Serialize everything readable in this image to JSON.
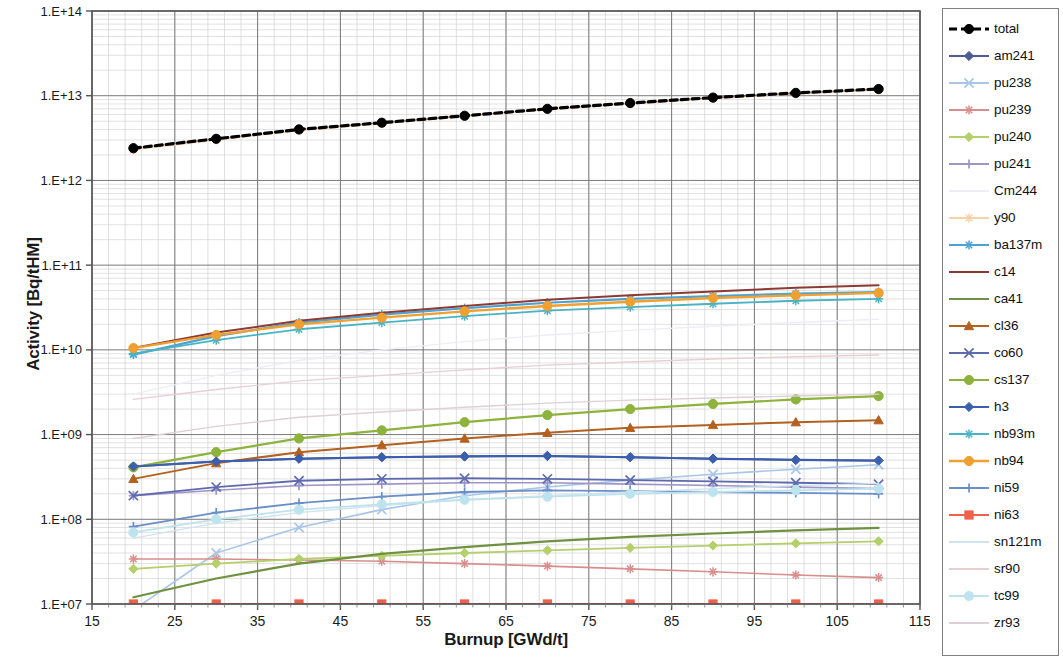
{
  "chart_data": {
    "type": "line",
    "title": "",
    "xlabel": "Burnup [GWd/t]",
    "ylabel": "Activity [Bq/tHM]",
    "yscale": "log",
    "xlim": [
      15,
      115
    ],
    "ylim": [
      10000000.0,
      100000000000000.0
    ],
    "xticks": [
      15,
      25,
      35,
      45,
      55,
      65,
      75,
      85,
      95,
      105,
      115
    ],
    "xtick_labels": [
      "15",
      "25",
      "35",
      "45",
      "55",
      "65",
      "75",
      "85",
      "95",
      "105",
      "115"
    ],
    "yticks": [
      10000000.0,
      100000000.0,
      1000000000.0,
      10000000000.0,
      100000000000.0,
      1000000000000.0,
      10000000000000.0,
      100000000000000.0
    ],
    "ytick_labels": [
      "1.E+07",
      "1.E+08",
      "1.E+09",
      "1.E+10",
      "1.E+11",
      "1.E+12",
      "1.E+13",
      "1.E+14"
    ],
    "grid": true,
    "minor_grid": true,
    "legend_position": "right",
    "x": [
      20,
      30,
      40,
      50,
      60,
      70,
      80,
      90,
      100,
      110
    ],
    "series": [
      {
        "name": "total",
        "color": "#000000",
        "marker": "circle",
        "marker_color": "#000000",
        "width": 3.2,
        "dash": "7,4",
        "values": [
          2400000000000.0,
          3100000000000.0,
          4000000000000.0,
          4800000000000.0,
          5800000000000.0,
          7000000000000.0,
          8200000000000.0,
          9500000000000.0,
          10800000000000.0,
          12000000000000.0
        ]
      },
      {
        "name": "am241",
        "color": "#4a5d96",
        "marker": "diamond",
        "width": 2.0,
        "values": [
          420000000.0,
          480000000.0,
          520000000.0,
          540000000.0,
          550000000.0,
          560000000.0,
          540000000.0,
          520000000.0,
          500000000.0,
          490000000.0
        ]
      },
      {
        "name": "pu238",
        "color": "#a8c6e8",
        "marker": "x",
        "width": 1.6,
        "values": [
          8500000.0,
          40000000.0,
          80000000.0,
          130000000.0,
          190000000.0,
          240000000.0,
          290000000.0,
          340000000.0,
          390000000.0,
          440000000.0
        ]
      },
      {
        "name": "pu239",
        "color": "#d98d8d",
        "marker": "star",
        "width": 1.6,
        "values": [
          34000000.0,
          34000000.0,
          33000000.0,
          32000000.0,
          30000000.0,
          28000000.0,
          26000000.0,
          24000000.0,
          22000000.0,
          20500000.0
        ]
      },
      {
        "name": "pu240",
        "color": "#b5cf6b",
        "marker": "diamond",
        "width": 1.8,
        "values": [
          26000000.0,
          30000000.0,
          34000000.0,
          37000000.0,
          40000000.0,
          43000000.0,
          46000000.0,
          49000000.0,
          52000000.0,
          55000000.0
        ]
      },
      {
        "name": "pu241",
        "color": "#9d96c6",
        "marker": "plus",
        "width": 1.6,
        "values": [
          190000000.0,
          220000000.0,
          250000000.0,
          260000000.0,
          270000000.0,
          270000000.0,
          260000000.0,
          250000000.0,
          240000000.0,
          230000000.0
        ]
      },
      {
        "name": "Cm244",
        "color": "#f0ecf5",
        "marker": "none",
        "width": 1.4,
        "values": [
          3000000000.0,
          5000000000.0,
          7500000000.0,
          10000000000.0,
          12500000000.0,
          15000000000.0,
          17000000000.0,
          19000000000.0,
          21000000000.0,
          23000000000.0
        ]
      },
      {
        "name": "y90",
        "color": "#f9d0a8",
        "marker": "star",
        "width": 1.6,
        "values": [
          2300000000000.0,
          3000000000000.0,
          3900000000000.0,
          4700000000000.0,
          5700000000000.0,
          6900000000000.0,
          8000000000000.0,
          9300000000000.0,
          10500000000000.0,
          11700000000000.0
        ]
      },
      {
        "name": "ba137m",
        "color": "#4ba3d3",
        "marker": "star",
        "width": 2.2,
        "values": [
          8800000000.0,
          14500000000.0,
          21000000000.0,
          26000000000.0,
          31000000000.0,
          36000000000.0,
          40000000000.0,
          43000000000.0,
          46000000000.0,
          48000000000.0
        ]
      },
      {
        "name": "c14",
        "color": "#8c3b34",
        "marker": "none",
        "width": 2.0,
        "values": [
          10500000000.0,
          16000000000.0,
          22000000000.0,
          27500000000.0,
          33000000000.0,
          39000000000.0,
          44000000000.0,
          49000000000.0,
          54000000000.0,
          58000000000.0
        ]
      },
      {
        "name": "ca41",
        "color": "#6f9140",
        "marker": "none",
        "width": 2.2,
        "values": [
          12000000.0,
          20000000.0,
          30000000.0,
          39000000.0,
          47000000.0,
          55000000.0,
          62000000.0,
          68000000.0,
          74000000.0,
          79000000.0
        ]
      },
      {
        "name": "cl36",
        "color": "#b4601f",
        "marker": "triangle",
        "width": 2.0,
        "values": [
          300000000.0,
          460000000.0,
          620000000.0,
          750000000.0,
          900000000.0,
          1050000000.0,
          1200000000.0,
          1300000000.0,
          1400000000.0,
          1480000000.0
        ]
      },
      {
        "name": "co60",
        "color": "#5f6aae",
        "marker": "x",
        "width": 1.8,
        "values": [
          190000000.0,
          240000000.0,
          285000000.0,
          300000000.0,
          305000000.0,
          300000000.0,
          290000000.0,
          280000000.0,
          270000000.0,
          260000000.0
        ]
      },
      {
        "name": "cs137",
        "color": "#8db33c",
        "marker": "circle",
        "width": 2.2,
        "values": [
          410000000.0,
          620000000.0,
          900000000.0,
          1120000000.0,
          1400000000.0,
          1700000000.0,
          2000000000.0,
          2300000000.0,
          2600000000.0,
          2850000000.0
        ]
      },
      {
        "name": "h3",
        "color": "#3b5fae",
        "marker": "diamond",
        "width": 2.0,
        "values": [
          420000000.0,
          480000000.0,
          520000000.0,
          540000000.0,
          555000000.0,
          560000000.0,
          540000000.0,
          520000000.0,
          505000000.0,
          495000000.0
        ]
      },
      {
        "name": "nb93m",
        "color": "#49b3c4",
        "marker": "star",
        "width": 1.8,
        "values": [
          9000000000.0,
          13000000000.0,
          17500000000.0,
          21000000000.0,
          25000000000.0,
          29000000000.0,
          32000000000.0,
          35000000000.0,
          38000000000.0,
          40000000000.0
        ]
      },
      {
        "name": "nb94",
        "color": "#f0a030",
        "marker": "circle",
        "width": 2.4,
        "values": [
          10500000000.0,
          15000000000.0,
          20000000000.0,
          24000000000.0,
          28500000000.0,
          33000000000.0,
          37000000000.0,
          41000000000.0,
          44000000000.0,
          47000000000.0
        ]
      },
      {
        "name": "ni59",
        "color": "#6a8ec8",
        "marker": "plus",
        "width": 1.8,
        "values": [
          82000000.0,
          120000000.0,
          155000000.0,
          185000000.0,
          210000000.0,
          220000000.0,
          215000000.0,
          210000000.0,
          205000000.0,
          200000000.0
        ]
      },
      {
        "name": "ni63",
        "color": "#f0604a",
        "marker": "square",
        "width": 2.0,
        "values": [
          10000000.0,
          10000000.0,
          10000000.0,
          10000000.0,
          10000000.0,
          10000000.0,
          10000000.0,
          10000000.0,
          10000000.0,
          10000000.0
        ]
      },
      {
        "name": "sn121m",
        "color": "#cfe4ef",
        "marker": "none",
        "width": 1.4,
        "values": [
          60000000.0,
          90000000.0,
          120000000.0,
          145000000.0,
          170000000.0,
          190000000.0,
          210000000.0,
          230000000.0,
          250000000.0,
          265000000.0
        ]
      },
      {
        "name": "sr90",
        "color": "#e7cfd3",
        "marker": "none",
        "width": 1.4,
        "values": [
          2600000000.0,
          3400000000.0,
          4300000000.0,
          5000000000.0,
          5800000000.0,
          6600000000.0,
          7200000000.0,
          7800000000.0,
          8300000000.0,
          8700000000.0
        ]
      },
      {
        "name": "tc99",
        "color": "#bde3ee",
        "marker": "circle",
        "width": 1.8,
        "values": [
          70000000.0,
          100000000.0,
          130000000.0,
          150000000.0,
          170000000.0,
          185000000.0,
          200000000.0,
          210000000.0,
          220000000.0,
          230000000.0
        ]
      },
      {
        "name": "zr93",
        "color": "#ded0d8",
        "marker": "none",
        "width": 1.4,
        "values": [
          900000000.0,
          1250000000.0,
          1600000000.0,
          1850000000.0,
          2100000000.0,
          2350000000.0,
          2550000000.0,
          2700000000.0,
          2850000000.0,
          3000000000.0
        ]
      }
    ]
  },
  "legend": {
    "items": [
      {
        "label": "total"
      },
      {
        "label": "am241"
      },
      {
        "label": "pu238"
      },
      {
        "label": "pu239"
      },
      {
        "label": "pu240"
      },
      {
        "label": "pu241"
      },
      {
        "label": "Cm244"
      },
      {
        "label": "y90"
      },
      {
        "label": "ba137m"
      },
      {
        "label": "c14"
      },
      {
        "label": "ca41"
      },
      {
        "label": "cl36"
      },
      {
        "label": "co60"
      },
      {
        "label": "cs137"
      },
      {
        "label": "h3"
      },
      {
        "label": "nb93m"
      },
      {
        "label": "nb94"
      },
      {
        "label": "ni59"
      },
      {
        "label": "ni63"
      },
      {
        "label": "sn121m"
      },
      {
        "label": "sr90"
      },
      {
        "label": "tc99"
      },
      {
        "label": "zr93"
      }
    ]
  },
  "axes": {
    "x_title": "Burnup [GWd/t]",
    "y_title": "Activity [Bq/tHM]"
  }
}
